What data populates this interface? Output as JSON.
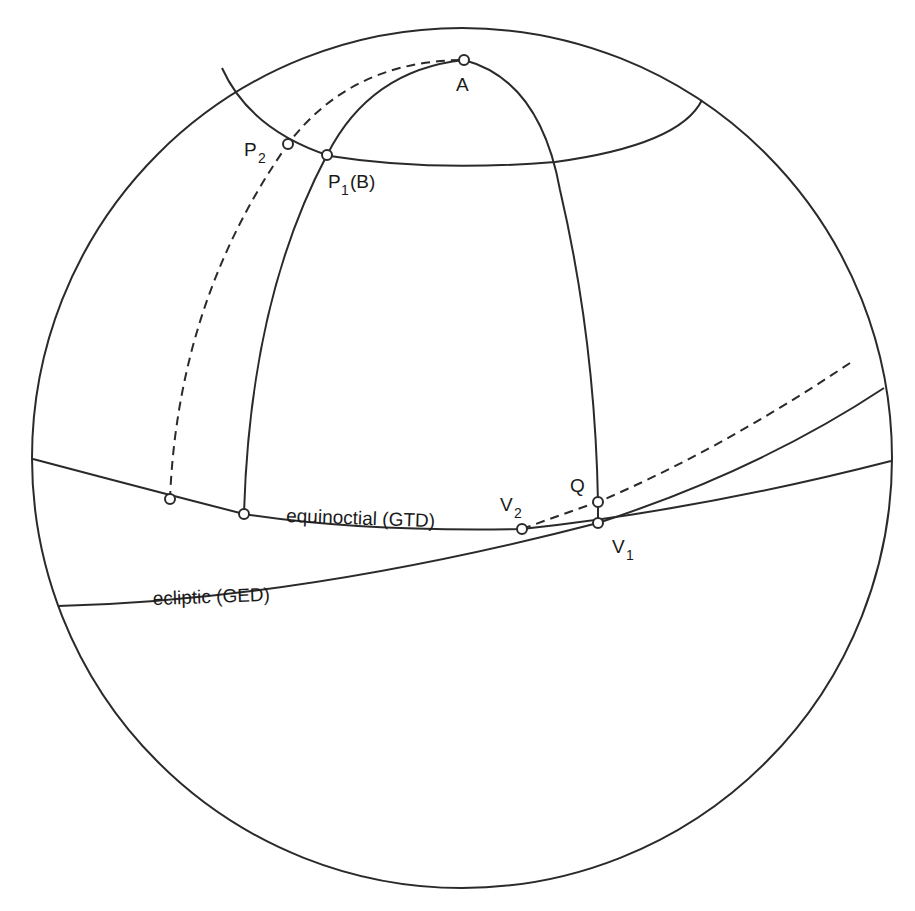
{
  "diagram": {
    "colors": {
      "stroke": "#2a2a2a",
      "background": "#ffffff"
    },
    "labels": {
      "A": "A",
      "P2_main": "P",
      "P2_sub": "2",
      "P1_main": "P",
      "P1_sub": "1",
      "P1_suffix": "(B)",
      "Q": "Q",
      "V2_main": "V",
      "V2_sub": "2",
      "V1_main": "V",
      "V1_sub": "1",
      "equinoctial": "equinoctial (GTD)",
      "ecliptic": "ecliptic (GED)"
    },
    "points": [
      {
        "name": "A",
        "x": 464,
        "y": 60
      },
      {
        "name": "P2",
        "x": 288,
        "y": 144
      },
      {
        "name": "P1 (B)",
        "x": 327,
        "y": 155
      },
      {
        "name": "unnamed-equinoctial-left",
        "x": 170,
        "y": 499
      },
      {
        "name": "unnamed-equinoctial-mid",
        "x": 244,
        "y": 514
      },
      {
        "name": "V2",
        "x": 522,
        "y": 529
      },
      {
        "name": "Q",
        "x": 598,
        "y": 502
      },
      {
        "name": "V1",
        "x": 598,
        "y": 523
      }
    ]
  }
}
